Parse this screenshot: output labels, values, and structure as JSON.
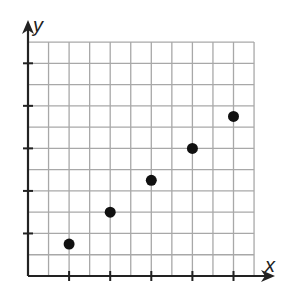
{
  "chart_data": {
    "type": "scatter",
    "title": "",
    "xlabel": "x",
    "ylabel": "y",
    "grid": true,
    "grid_cells": {
      "x": 11,
      "y": 11
    },
    "tick_every_gridlines": 2,
    "x_ticks_gridlines": [
      2,
      4,
      6,
      8,
      10
    ],
    "y_ticks_gridlines": [
      2,
      4,
      6,
      8,
      10
    ],
    "tick_labels": [],
    "xlim": [
      0,
      11
    ],
    "ylim": [
      0,
      11
    ],
    "series": [
      {
        "name": "points",
        "points": [
          {
            "x": 2,
            "y": 1.5
          },
          {
            "x": 4,
            "y": 3
          },
          {
            "x": 6,
            "y": 4.5
          },
          {
            "x": 8,
            "y": 6
          },
          {
            "x": 10,
            "y": 7.5
          }
        ]
      }
    ],
    "legend": null
  },
  "labels": {
    "x_axis": "x",
    "y_axis": "y"
  },
  "colors": {
    "grid": "#a8a8a8",
    "axis": "#222222",
    "point": "#111111",
    "background": "#ffffff"
  },
  "layout": {
    "origin_px": [
      28,
      276
    ],
    "cell_w_px": 20.55,
    "cell_h_px": 21.27,
    "x_arrow_end_px": 275,
    "y_arrow_end_px": 20,
    "point_radius_px": 5.5
  }
}
